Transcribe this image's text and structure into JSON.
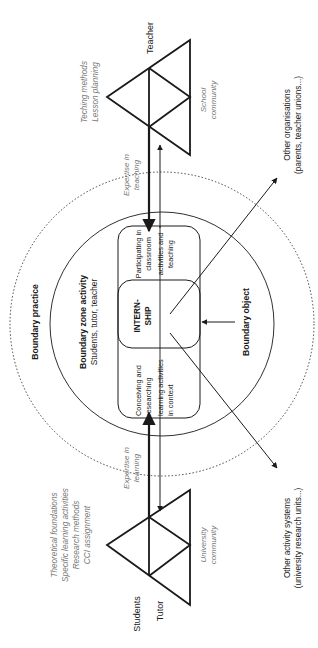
{
  "colors": {
    "ink": "#1a1a1a",
    "muted_text": "#777777",
    "background": "#ffffff"
  },
  "teacher_system": {
    "subject_label": "Teacher",
    "tools_lines": [
      "Teching methods",
      "Lesson planning"
    ],
    "community_lines": [
      "School",
      "community"
    ]
  },
  "university_system": {
    "subject_label_1": "Students",
    "subject_label_2": "Tutor",
    "tools_lines": [
      "Theoretical foundations",
      "Specific learning activities",
      "Research methods",
      "CCI assignment"
    ],
    "community_lines": [
      "University",
      "community"
    ]
  },
  "expertise": {
    "teaching_lines": [
      "Expertise in",
      "teaching"
    ],
    "learning_lines": [
      "Expertise in",
      "learning"
    ]
  },
  "boundary_practice": {
    "label": "Boundary practice"
  },
  "boundary_zone": {
    "title": "Boundary zone activity",
    "participants": "Students, tutor, teacher"
  },
  "activities": {
    "teaching_side_lines": [
      "Participating in",
      "classroom",
      "activities and",
      "teaching"
    ],
    "learning_side_lines": [
      "Conceiving and",
      "researching",
      "learning activities",
      "in context"
    ],
    "center_lines": [
      "INTERN-",
      "SHIP"
    ]
  },
  "boundary_object": {
    "label": "Boundary object"
  },
  "other_organisations": {
    "lines": [
      "Other organisations",
      "(parents, teacher unions...)"
    ]
  },
  "other_activity_systems": {
    "lines": [
      "Other activity systems",
      "(university research units...)"
    ]
  }
}
